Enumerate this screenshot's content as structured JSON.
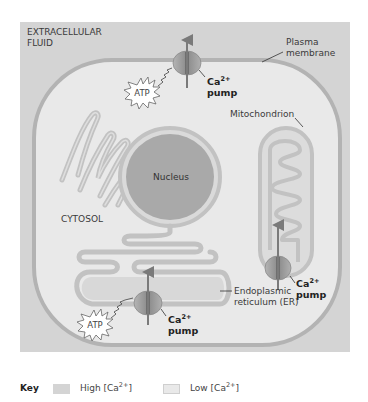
{
  "diagram": {
    "colors": {
      "high_ca": "#d4d4d4",
      "low_ca": "#e9e9e9",
      "membrane": "#b3b3b3",
      "nucleus": "#a9a9a9",
      "pump": "#8e8e8e",
      "arrow": "#7a7a7a"
    },
    "regions": {
      "extracellular": "EXTRACELLULAR\nFLUID",
      "extracellular_line1": "EXTRACELLULAR",
      "extracellular_line2": "FLUID",
      "cytosol": "CYTOSOL",
      "nucleus": "Nucleus"
    },
    "labels": {
      "plasma_membrane_line1": "Plasma",
      "plasma_membrane_line2": "membrane",
      "mitochondrion": "Mitochondrion",
      "er_line1": "Endoplasmic",
      "er_line2": "reticulum (ER)"
    },
    "pumps": [
      {
        "location": "plasma-membrane",
        "label_base": "Ca",
        "label_sup": "2+",
        "label_line2": "pump",
        "energy": "ATP"
      },
      {
        "location": "mitochondrion",
        "label_base": "Ca",
        "label_sup": "2+",
        "label_line2": "pump"
      },
      {
        "location": "endoplasmic-reticulum",
        "label_base": "Ca",
        "label_sup": "2+",
        "label_line2": "pump",
        "energy": "ATP"
      }
    ],
    "key": {
      "title": "Key",
      "items": [
        {
          "label_base": "High [Ca",
          "label_sup": "2+",
          "label_end": "]",
          "color": "#d4d4d4"
        },
        {
          "label_base": "Low [Ca",
          "label_sup": "2+",
          "label_end": "]",
          "color": "#e9e9e9"
        }
      ]
    }
  }
}
